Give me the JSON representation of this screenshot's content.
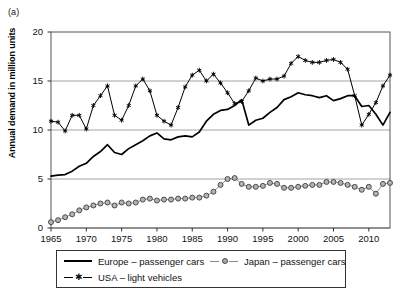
{
  "panel_label": "(a)",
  "chart_data": {
    "type": "line",
    "title": "",
    "xlabel": "",
    "ylabel": "Annual demand in million units",
    "xlim": [
      1965,
      2013
    ],
    "ylim": [
      0,
      20
    ],
    "yticks": [
      0,
      5,
      10,
      15,
      20
    ],
    "xticks": [
      1965,
      1970,
      1975,
      1980,
      1985,
      1990,
      1995,
      2000,
      2005,
      2010
    ],
    "grid": "horizontal",
    "legend_position": "below-plot",
    "x": [
      1965,
      1966,
      1967,
      1968,
      1969,
      1970,
      1971,
      1972,
      1973,
      1974,
      1975,
      1976,
      1977,
      1978,
      1979,
      1980,
      1981,
      1982,
      1983,
      1984,
      1985,
      1986,
      1987,
      1988,
      1989,
      1990,
      1991,
      1992,
      1993,
      1994,
      1995,
      1996,
      1997,
      1998,
      1999,
      2000,
      2001,
      2002,
      2003,
      2004,
      2005,
      2006,
      2007,
      2008,
      2009,
      2010,
      2011,
      2012,
      2013
    ],
    "series": [
      {
        "name": "Europe – passenger cars",
        "marker": "none",
        "color": "#000000",
        "values": [
          5.3,
          5.4,
          5.45,
          5.8,
          6.3,
          6.6,
          7.3,
          7.8,
          8.5,
          7.7,
          7.5,
          8.1,
          8.5,
          8.9,
          9.4,
          9.7,
          9.1,
          9.0,
          9.3,
          9.4,
          9.3,
          9.8,
          10.9,
          11.6,
          12.0,
          12.1,
          12.5,
          13.1,
          10.5,
          11.0,
          11.2,
          11.8,
          12.3,
          13.1,
          13.4,
          13.8,
          13.6,
          13.5,
          13.3,
          13.5,
          13.0,
          13.2,
          13.5,
          13.5,
          12.4,
          12.5,
          11.6,
          10.5,
          11.8
        ]
      },
      {
        "name": "Japan – passenger cars",
        "marker": "circle",
        "color": "#9d9d9d",
        "values": [
          0.6,
          0.8,
          1.1,
          1.4,
          1.8,
          2.1,
          2.3,
          2.5,
          2.6,
          2.3,
          2.6,
          2.5,
          2.6,
          2.9,
          3.0,
          2.8,
          2.9,
          2.9,
          3.0,
          3.0,
          3.1,
          3.1,
          3.3,
          3.7,
          4.4,
          5.0,
          5.1,
          4.5,
          4.2,
          4.2,
          4.3,
          4.6,
          4.5,
          4.1,
          4.1,
          4.2,
          4.3,
          4.4,
          4.4,
          4.7,
          4.7,
          4.6,
          4.4,
          4.2,
          3.9,
          4.2,
          3.5,
          4.5,
          4.6
        ]
      },
      {
        "name": "USA – light vehicles",
        "marker": "asterisk",
        "color": "#000000",
        "values": [
          10.9,
          10.8,
          9.9,
          11.5,
          11.5,
          10.1,
          12.5,
          13.5,
          14.5,
          11.5,
          11.0,
          12.5,
          14.5,
          15.2,
          14.0,
          11.5,
          10.9,
          10.5,
          12.3,
          14.4,
          15.6,
          16.1,
          15.0,
          15.7,
          14.8,
          13.8,
          12.7,
          12.9,
          14.0,
          15.3,
          15.0,
          15.2,
          15.2,
          15.5,
          16.8,
          17.5,
          17.1,
          16.9,
          16.9,
          17.1,
          17.2,
          16.9,
          16.2,
          13.5,
          10.5,
          11.6,
          12.8,
          14.5,
          15.6
        ]
      }
    ]
  },
  "legend": {
    "entries": [
      {
        "label": "Europe – passenger cars",
        "marker": "line",
        "icon": "solid-line-icon"
      },
      {
        "label": "Japan – passenger cars",
        "marker": "circle",
        "icon": "circle-marker-icon"
      },
      {
        "label": "USA – light vehicles",
        "marker": "asterisk",
        "icon": "asterisk-marker-icon"
      }
    ]
  }
}
